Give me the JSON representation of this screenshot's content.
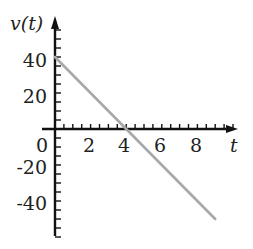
{
  "chart_data": {
    "type": "line",
    "title": "",
    "xlabel": "t",
    "ylabel": "v(t)",
    "x": [
      0,
      9
    ],
    "series": [
      {
        "name": "v(t)",
        "x": [
          0,
          1,
          2,
          3,
          4,
          5,
          6,
          7,
          8,
          9
        ],
        "values": [
          40,
          30,
          20,
          10,
          0,
          -10,
          -20,
          -30,
          -40,
          -50
        ],
        "color": "#a8a8a8"
      }
    ],
    "xticks": [
      "0",
      "2",
      "4",
      "6",
      "8"
    ],
    "yticks": [
      "40",
      "20",
      "0",
      "-20",
      "-40"
    ],
    "xlim": [
      0,
      10.2
    ],
    "ylim": [
      -62,
      60
    ],
    "grid": false,
    "legend": null
  },
  "labels": {
    "ylabel": "v(t)",
    "xlabel": "t",
    "x_ticks": [
      {
        "text": "2",
        "val": 2
      },
      {
        "text": "4",
        "val": 4
      },
      {
        "text": "6",
        "val": 6
      },
      {
        "text": "8",
        "val": 8
      }
    ],
    "origin": "0",
    "y_ticks": [
      {
        "text": "40",
        "val": 40
      },
      {
        "text": "20",
        "val": 20
      },
      {
        "text": "-20",
        "val": -20
      },
      {
        "text": "-40",
        "val": -40
      }
    ]
  },
  "colors": {
    "axis": "#111111",
    "line": "#a8a8a8"
  }
}
